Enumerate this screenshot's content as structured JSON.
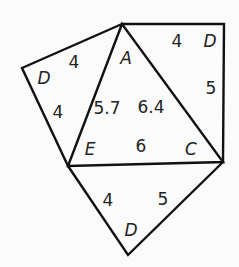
{
  "diagram": {
    "title": "",
    "vertices": {
      "A": {
        "label": "A",
        "pos": [
          122,
          24
        ]
      },
      "E": {
        "label": "E",
        "pos": [
          68,
          166
        ]
      },
      "C": {
        "label": "C",
        "pos": [
          223,
          162
        ]
      },
      "D_left": {
        "label": "D",
        "pos": [
          22,
          68
        ]
      },
      "D_right": {
        "label": "D",
        "pos": [
          224,
          24
        ]
      },
      "D_bottom": {
        "label": "D",
        "pos": [
          128,
          255
        ]
      }
    },
    "labels": {
      "vertex_A": "A",
      "vertex_E": "E",
      "vertex_C": "C",
      "vertex_D_left": "D",
      "vertex_D_right": "D",
      "vertex_D_bottom": "D",
      "len_AD_left": "4",
      "len_ED_left": "4",
      "len_AD_right": "4",
      "len_CD_right": "5",
      "len_AE": "5.7",
      "len_AC": "6.4",
      "len_EC": "6",
      "len_ED_bottom": "4",
      "len_CD_bottom": "5"
    },
    "colors": {
      "stroke": "#111111",
      "text": "#222222",
      "background": "#fbfbfb"
    }
  }
}
